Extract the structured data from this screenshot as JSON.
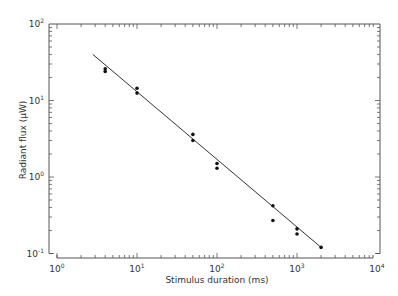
{
  "chart_data": {
    "type": "scatter",
    "title": "",
    "xlabel": "Stimulus duration (ms)",
    "ylabel": "Radiant flux (μW)",
    "xscale": "log",
    "yscale": "log",
    "xlim": [
      1,
      10000
    ],
    "ylim": [
      0.1,
      100
    ],
    "grid": false,
    "legend": null,
    "x_ticks": [
      {
        "base": "10",
        "exp": "0",
        "value": 1
      },
      {
        "base": "10",
        "exp": "1",
        "value": 10
      },
      {
        "base": "10",
        "exp": "2",
        "value": 100
      },
      {
        "base": "10",
        "exp": "3",
        "value": 1000
      },
      {
        "base": "10",
        "exp": "4",
        "value": 10000
      }
    ],
    "y_ticks": [
      {
        "base": "10",
        "exp": "-1",
        "value": 0.1
      },
      {
        "base": "10",
        "exp": "0",
        "value": 1
      },
      {
        "base": "10",
        "exp": "1",
        "value": 10
      },
      {
        "base": "10",
        "exp": "2",
        "value": 100
      }
    ],
    "series": [
      {
        "name": "measurements",
        "kind": "points",
        "x": [
          4,
          4,
          10,
          10,
          50,
          50,
          100,
          100,
          500,
          500,
          1000,
          1000,
          2000
        ],
        "y": [
          26,
          24,
          14.5,
          12.5,
          3.6,
          3.0,
          1.5,
          1.3,
          0.42,
          0.27,
          0.21,
          0.18,
          0.12
        ]
      },
      {
        "name": "fit line",
        "kind": "line",
        "x": [
          2.8,
          2000
        ],
        "y": [
          40,
          0.12
        ]
      }
    ]
  }
}
